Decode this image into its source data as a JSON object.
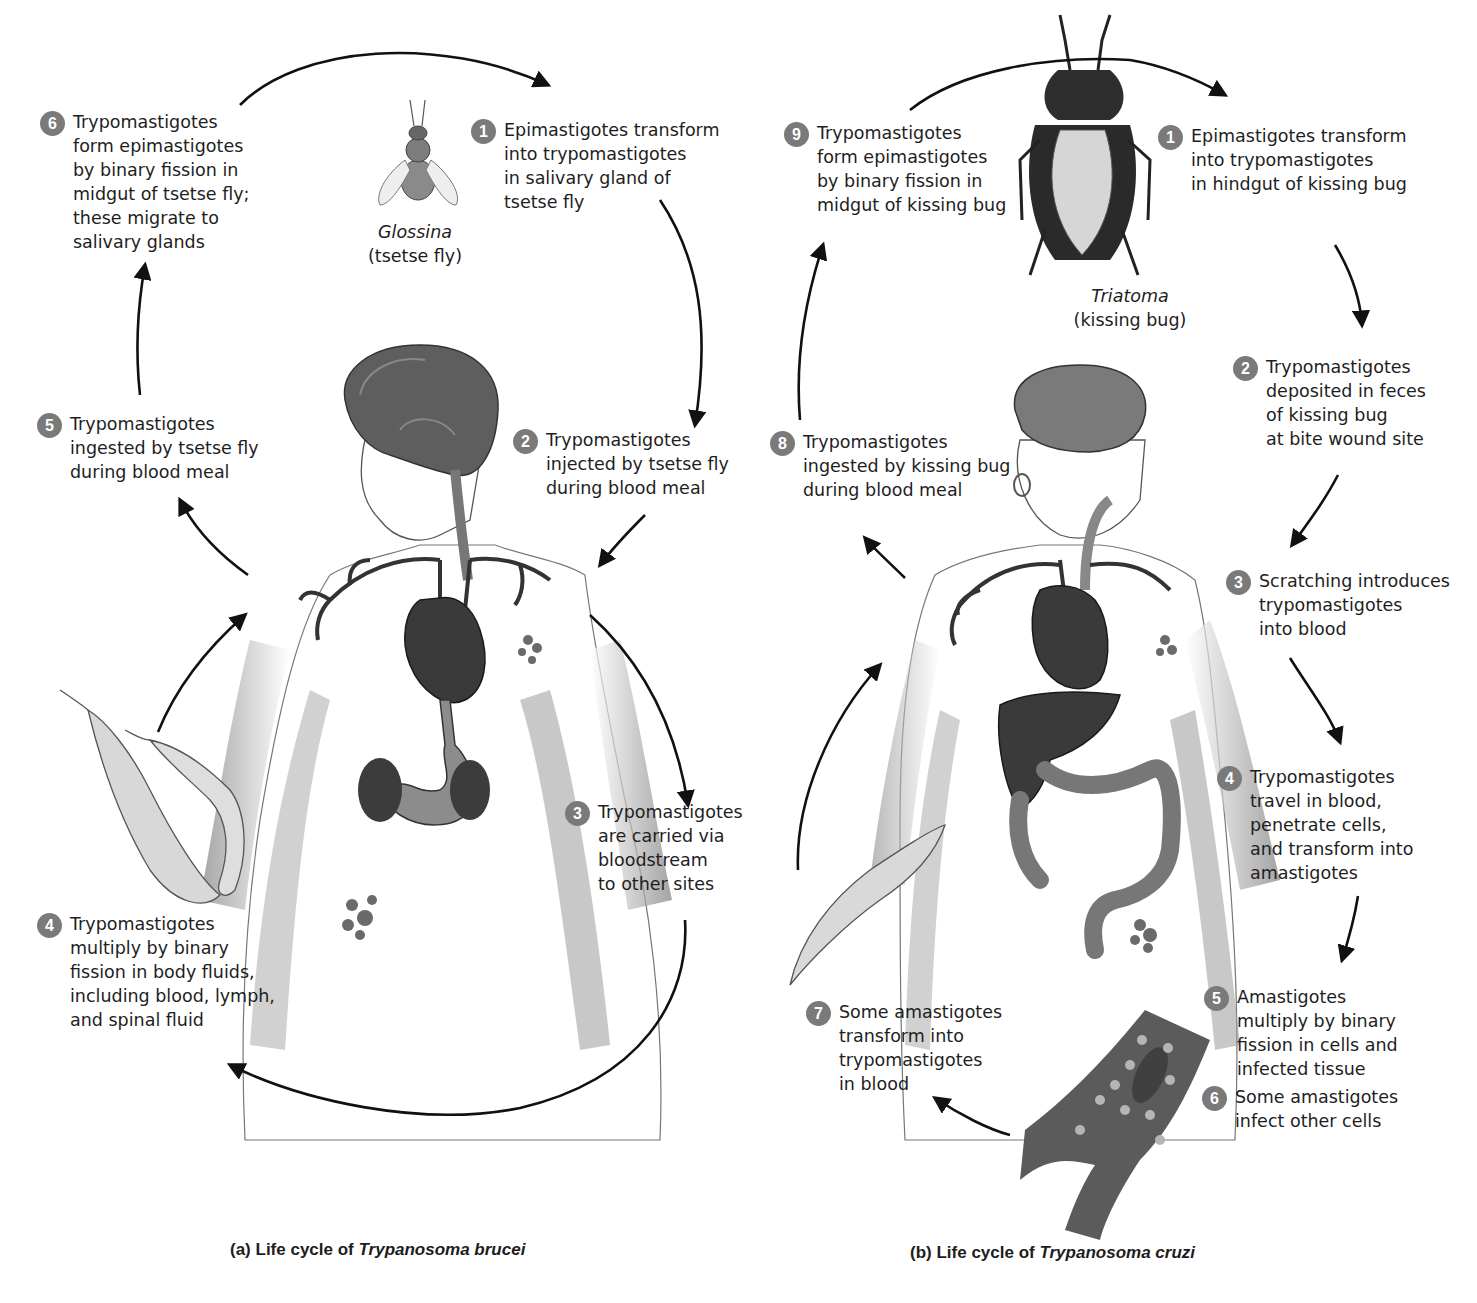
{
  "colors": {
    "badge": "#7a7a7a",
    "arrow": "#111111",
    "organ_dark": "#3a3a3a",
    "body_shade": "#8a8a8a",
    "text": "#1e1e1e"
  },
  "panel_a": {
    "caption_prefix": "(a) Life cycle of ",
    "caption_species": "Trypanosoma brucei",
    "vector": {
      "genus": "Glossina",
      "common": "(tsetse fly)",
      "icon": "tsetse-fly-illustration"
    },
    "steps": [
      {
        "num": "1",
        "text": "Epimastigotes transform\ninto trypomastigotes\nin salivary gland of\ntsetse fly"
      },
      {
        "num": "2",
        "text": "Trypomastigotes\ninjected by tsetse fly\nduring blood meal"
      },
      {
        "num": "3",
        "text": "Trypomastigotes\nare carried via\nbloodstream\nto other sites"
      },
      {
        "num": "4",
        "text": "Trypomastigotes\nmultiply by binary\nfission in body fluids,\nincluding blood, lymph,\nand spinal fluid"
      },
      {
        "num": "5",
        "text": "Trypomastigotes\ningested by tsetse fly\nduring blood meal"
      },
      {
        "num": "6",
        "text": "Trypomastigotes\nform epimastigotes\nby binary fission in\nmidgut of tsetse fly;\nthese migrate to\nsalivary glands"
      }
    ],
    "illustrations": [
      "human-body-male",
      "brain",
      "heart",
      "stomach",
      "kidneys",
      "blood-vessels",
      "trypanosome-cluster",
      "trypomastigote-parasites"
    ]
  },
  "panel_b": {
    "caption_prefix": "(b) Life cycle of ",
    "caption_species": "Trypanosoma cruzi",
    "vector": {
      "genus": "Triatoma",
      "common": "(kissing bug)",
      "icon": "kissing-bug-illustration"
    },
    "steps": [
      {
        "num": "1",
        "text": "Epimastigotes transform\ninto trypomastigotes\nin hindgut of kissing bug"
      },
      {
        "num": "2",
        "text": "Trypomastigotes\ndeposited in feces\nof kissing bug\nat bite wound site"
      },
      {
        "num": "3",
        "text": "Scratching introduces\ntrypomastigotes\ninto blood"
      },
      {
        "num": "4",
        "text": "Trypomastigotes\n travel in blood,\npenetrate cells,\nand transform into\namastigotes"
      },
      {
        "num": "5",
        "text": "Amastigotes\nmultiply by binary\nfission in cells and\ninfected tissue"
      },
      {
        "num": "6",
        "text": "Some amastigotes\ninfect other cells"
      },
      {
        "num": "7",
        "text": "Some amastigotes\ntransform into\ntrypomastigotes\nin blood"
      },
      {
        "num": "8",
        "text": "Trypomastigotes\ningested by kissing bug\nduring blood meal"
      },
      {
        "num": "9",
        "text": "Trypomastigotes\nform epimastigotes\nby binary fission in\nmidgut of kissing bug"
      }
    ],
    "illustrations": [
      "human-body-female",
      "brain",
      "heart",
      "liver",
      "colon",
      "blood-vessels",
      "trypanosome-cluster",
      "muscle-tissue-with-amastigotes",
      "trypomastigote-parasite"
    ]
  }
}
